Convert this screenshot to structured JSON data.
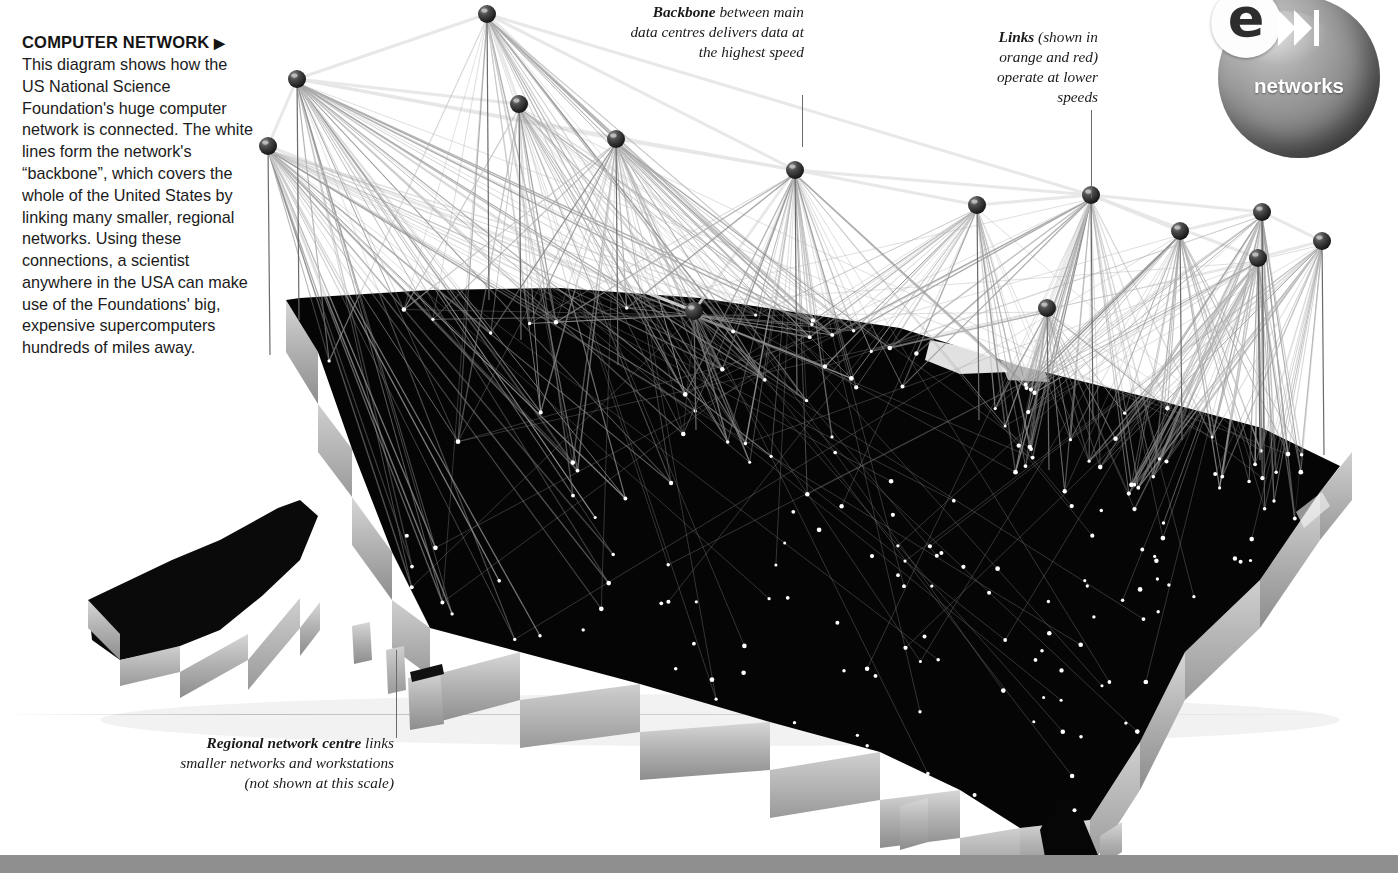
{
  "page": {
    "background_color": "#ffffff",
    "footer_bar_color": "#8f8f8f"
  },
  "intro": {
    "title": "COMPUTER NETWORK",
    "title_arrow": "▶",
    "body": "This diagram shows how the US National Science Foundation's huge computer network is connected. The white lines form the network's “backbone”, which covers the whole of the United States by linking many smaller, regional networks. Using these connections, a scientist anywhere in the USA can make use of the Foundations' big, expensive supercomputers hundreds of miles away."
  },
  "callouts": {
    "backbone": {
      "lead": "Backbone",
      "rest": " between main data centres delivers data at the highest speed"
    },
    "links": {
      "lead": "Links",
      "rest": " (shown in orange and red) operate at lower speeds"
    },
    "regional": {
      "lead": "Regional network centre",
      "rest": " links smaller networks and workstations (not shown at this scale)"
    }
  },
  "badge": {
    "mark": "e",
    "chevron_icon": "skip-forward-icon",
    "label": "networks",
    "sphere_color": "#8c8c8c",
    "label_color": "#ffffff"
  },
  "chart_data": {
    "type": "scatter",
    "xlabel": "",
    "ylabel": "",
    "legend": [
      "backbone (white lines)",
      "links (orange and red lines)"
    ],
    "legend_position": "annotations",
    "grid": false,
    "backbone_nodes": [
      {
        "id": "n1",
        "x": 487,
        "y": 14,
        "stem_to_y": 300,
        "links": 22
      },
      {
        "id": "n2",
        "x": 297,
        "y": 79,
        "stem_to_y": 320,
        "links": 34
      },
      {
        "id": "n3",
        "x": 268,
        "y": 146,
        "stem_to_y": 355,
        "links": 30
      },
      {
        "id": "n4",
        "x": 519,
        "y": 104,
        "stem_to_y": 340,
        "links": 24
      },
      {
        "id": "n5",
        "x": 616,
        "y": 139,
        "stem_to_y": 365,
        "links": 26
      },
      {
        "id": "n6",
        "x": 795,
        "y": 170,
        "stem_to_y": 395,
        "links": 30
      },
      {
        "id": "n7",
        "x": 694,
        "y": 311,
        "stem_to_y": 430,
        "links": 18
      },
      {
        "id": "n8",
        "x": 977,
        "y": 205,
        "stem_to_y": 420,
        "links": 24
      },
      {
        "id": "n9",
        "x": 1091,
        "y": 195,
        "stem_to_y": 420,
        "links": 28
      },
      {
        "id": "n10",
        "x": 1180,
        "y": 231,
        "stem_to_y": 440,
        "links": 22
      },
      {
        "id": "n11",
        "x": 1262,
        "y": 212,
        "stem_to_y": 440,
        "links": 26
      },
      {
        "id": "n12",
        "x": 1322,
        "y": 241,
        "stem_to_y": 455,
        "links": 24
      },
      {
        "id": "n13",
        "x": 1258,
        "y": 258,
        "stem_to_y": 460,
        "links": 30
      },
      {
        "id": "n14",
        "x": 1047,
        "y": 308,
        "stem_to_y": 470,
        "links": 20
      }
    ],
    "backbone_edges": [
      [
        "n2",
        "n1"
      ],
      [
        "n1",
        "n4"
      ],
      [
        "n1",
        "n5"
      ],
      [
        "n2",
        "n3"
      ],
      [
        "n2",
        "n4"
      ],
      [
        "n2",
        "n5"
      ],
      [
        "n1",
        "n6"
      ],
      [
        "n5",
        "n6"
      ],
      [
        "n6",
        "n8"
      ],
      [
        "n8",
        "n9"
      ],
      [
        "n9",
        "n11"
      ],
      [
        "n9",
        "n10"
      ],
      [
        "n10",
        "n11"
      ],
      [
        "n11",
        "n12"
      ],
      [
        "n12",
        "n13"
      ],
      [
        "n9",
        "n13"
      ],
      [
        "n6",
        "n9"
      ],
      [
        "n3",
        "n7"
      ],
      [
        "n7",
        "n6"
      ],
      [
        "n14",
        "n9"
      ],
      [
        "n13",
        "n11"
      ],
      [
        "n1",
        "n9"
      ],
      [
        "n2",
        "n6"
      ]
    ],
    "regional_dot_count": 186,
    "node_color": "#2b2b2b",
    "map_top_color": "#000000",
    "map_side_color": "#b4b4b4",
    "backbone_line_color": "#e6e6e6",
    "link_line_color": "#8a8a8a",
    "regional_dot_color": "#ffffff"
  }
}
